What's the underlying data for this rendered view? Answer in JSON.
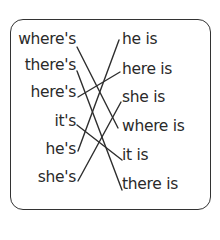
{
  "left_column": [
    "where's",
    "there's",
    "here's",
    "it's",
    "he's",
    "she's"
  ],
  "right_column": [
    "he is",
    "here is",
    "she is",
    "where is",
    "it is",
    "there is"
  ],
  "matches": [
    {
      "from": "where's",
      "to": "where is"
    },
    {
      "from": "there's",
      "to": "there is"
    },
    {
      "from": "here's",
      "to": "here is"
    },
    {
      "from": "it's",
      "to": "it is"
    },
    {
      "from": "he's",
      "to": "he is"
    },
    {
      "from": "she's",
      "to": "she is"
    }
  ],
  "colors": {
    "ink": "#2a2a2a",
    "background": "#ffffff"
  }
}
